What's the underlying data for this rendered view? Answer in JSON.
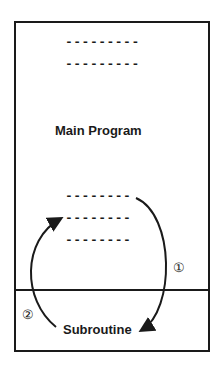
{
  "diagram": {
    "main_block": {
      "label": "Main Program",
      "code_lines_top": [
        "---------",
        "---------"
      ],
      "code_lines_bottom": [
        "--------",
        "--------",
        "--------"
      ]
    },
    "sub_block": {
      "label": "Subroutine"
    },
    "arrows": [
      {
        "id": "1",
        "marker": "①",
        "from": "Main Program",
        "to": "Subroutine"
      },
      {
        "id": "2",
        "marker": "②",
        "from": "Subroutine",
        "to": "Main Program"
      }
    ]
  }
}
